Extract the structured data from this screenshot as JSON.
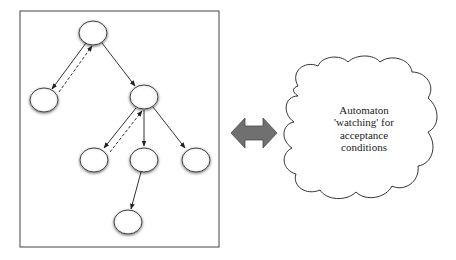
{
  "diagram": {
    "title": "",
    "tree_panel": {
      "nodes": [
        {
          "id": "root",
          "cx": 93,
          "cy": 33
        },
        {
          "id": "left",
          "cx": 44,
          "cy": 100
        },
        {
          "id": "mid",
          "cx": 144,
          "cy": 97
        },
        {
          "id": "c1",
          "cx": 94,
          "cy": 159
        },
        {
          "id": "c2",
          "cx": 144,
          "cy": 159
        },
        {
          "id": "c3",
          "cx": 196,
          "cy": 159
        },
        {
          "id": "leaf",
          "cx": 128,
          "cy": 222
        }
      ],
      "edges": [
        {
          "from": "root",
          "to": "left",
          "style": "solid"
        },
        {
          "from": "left",
          "to": "root",
          "style": "dashed"
        },
        {
          "from": "root",
          "to": "mid",
          "style": "solid"
        },
        {
          "from": "mid",
          "to": "c1",
          "style": "solid"
        },
        {
          "from": "c1",
          "to": "mid",
          "style": "dashed"
        },
        {
          "from": "mid",
          "to": "c2",
          "style": "solid"
        },
        {
          "from": "mid",
          "to": "c3",
          "style": "solid"
        },
        {
          "from": "c2",
          "to": "leaf",
          "style": "solid"
        }
      ]
    },
    "connector": {
      "type": "double-arrow",
      "color": "#707070"
    },
    "cloud": {
      "lines": [
        "Automaton",
        "'watching' for",
        "acceptance",
        "conditions"
      ]
    }
  }
}
